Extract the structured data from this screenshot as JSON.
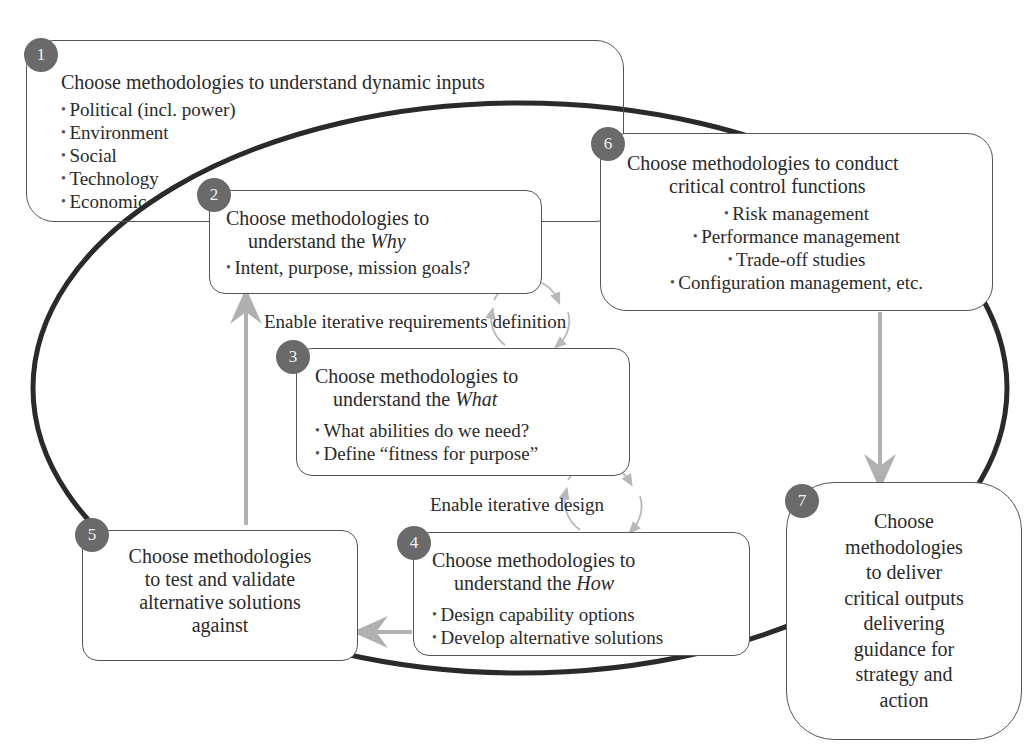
{
  "diagram": {
    "colors": {
      "ellipse_stroke": "#2a2a2a",
      "box_border": "#555555",
      "badge_fill": "#6a6a6a",
      "arrow_gray": "#b0b0b0",
      "cycle_gray": "#b8b8b8",
      "text": "#2a2a2a"
    },
    "steps": [
      {
        "number": "1",
        "title": "Choose methodologies to understand dynamic inputs",
        "bullets": [
          "Political (incl. power)",
          "Environment",
          "Social",
          "Technology",
          "Economic"
        ]
      },
      {
        "number": "2",
        "title_line1": "Choose methodologies to",
        "title_line2_prefix": "understand the ",
        "title_line2_em": "Why",
        "bullets": [
          "Intent, purpose, mission goals?"
        ]
      },
      {
        "number": "3",
        "title_line1": "Choose methodologies to",
        "title_line2_prefix": "understand the ",
        "title_line2_em": "What",
        "bullets": [
          "What abilities do we need?",
          "Define “fitness for purpose”"
        ]
      },
      {
        "number": "4",
        "title_line1": "Choose methodologies to",
        "title_line2_prefix": "understand the ",
        "title_line2_em": "How",
        "bullets": [
          "Design capability options",
          "Develop alternative solutions"
        ]
      },
      {
        "number": "5",
        "lines": [
          "Choose methodologies",
          "to test and validate",
          "alternative solutions",
          "against"
        ]
      },
      {
        "number": "6",
        "title_line1": "Choose methodologies to conduct",
        "title_line2": "critical control functions",
        "bullets": [
          "Risk management",
          "Performance management",
          "Trade-off studies",
          "Configuration management, etc."
        ]
      },
      {
        "number": "7",
        "lines": [
          "Choose",
          "methodologies",
          "to deliver",
          "critical outputs",
          "delivering",
          "guidance for",
          "strategy and",
          "action"
        ]
      }
    ],
    "cycle_labels": {
      "requirements": "Enable iterative requirements definition",
      "design": "Enable iterative design"
    },
    "connectors": [
      {
        "from": "5",
        "to": "2",
        "direction": "up"
      },
      {
        "from": "6",
        "to": "7",
        "direction": "down"
      },
      {
        "from": "4",
        "to": "5",
        "direction": "left"
      }
    ]
  }
}
